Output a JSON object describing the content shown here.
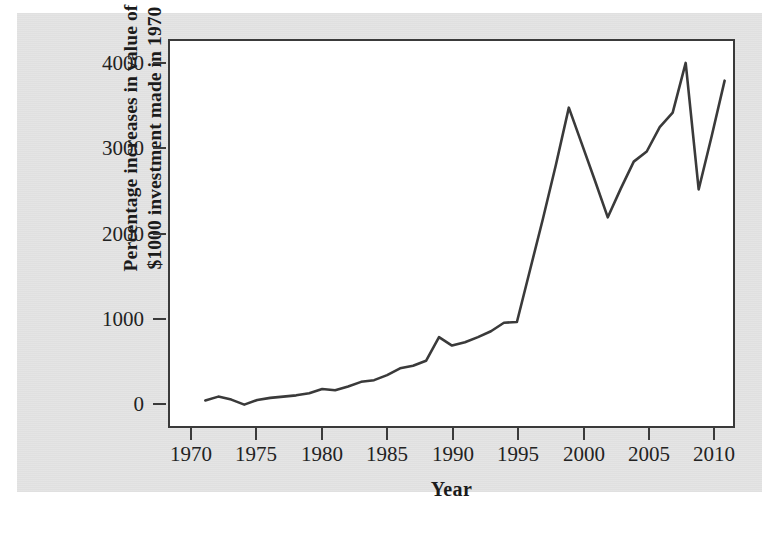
{
  "figure": {
    "background_color": "#e4e4e4",
    "plot_background_color": "#ffffff",
    "frame_color": "#3a3a3a",
    "line_color": "#3a3a3a"
  },
  "chart_data": {
    "type": "line",
    "title": "",
    "xlabel": "Year",
    "ylabel_line1": "Percentage increases in value of",
    "ylabel_line2": "$1000 investment made in 1970",
    "ylabel": "Percentage increases in value of $1000 investment made in 1970",
    "xlim": [
      1969,
      2012
    ],
    "ylim": [
      -300,
      4300
    ],
    "xticks": [
      1970,
      1975,
      1980,
      1985,
      1990,
      1995,
      2000,
      2005,
      2010
    ],
    "xtick_labels": [
      "1970",
      "1975",
      "1980",
      "1985",
      "1990",
      "1995",
      "2000",
      "2005",
      "2010"
    ],
    "yticks": [
      0,
      1000,
      2000,
      3000,
      4000
    ],
    "ytick_labels": [
      "0",
      "1000",
      "2000",
      "3000",
      "4000"
    ],
    "grid": false,
    "legend": false,
    "series": [
      {
        "name": "Percentage increase in value of $1000 invested in 1970",
        "x": [
          1971,
          1972,
          1973,
          1974,
          1975,
          1976,
          1977,
          1978,
          1979,
          1980,
          1981,
          1982,
          1983,
          1984,
          1985,
          1986,
          1987,
          1988,
          1989,
          1990,
          1991,
          1992,
          1993,
          1994,
          1995,
          1996,
          1997,
          1998,
          1999,
          2000,
          2001,
          2002,
          2003,
          2004,
          2005,
          2006,
          2007,
          2008,
          2009,
          2010,
          2011
        ],
        "values": [
          10,
          55,
          20,
          -40,
          15,
          40,
          55,
          70,
          95,
          145,
          130,
          175,
          230,
          250,
          310,
          390,
          420,
          480,
          760,
          660,
          700,
          760,
          830,
          930,
          940,
          1550,
          2160,
          2800,
          3480,
          3050,
          2620,
          2180,
          2520,
          2840,
          2960,
          3250,
          3420,
          4010,
          2510,
          3140,
          3800
        ]
      }
    ]
  }
}
